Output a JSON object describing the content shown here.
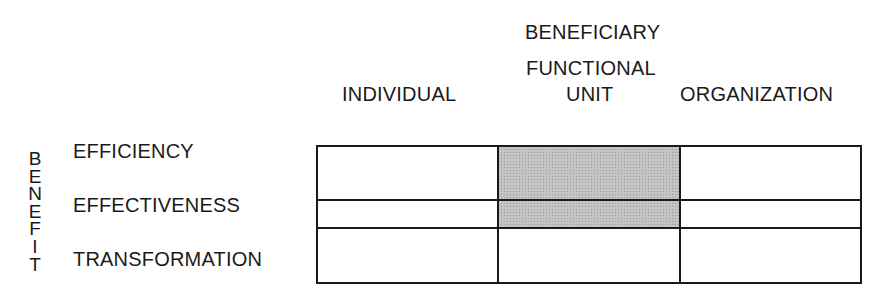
{
  "column_group_label": "BENEFICIARY",
  "columns": [
    {
      "label_line1": "",
      "label_line2": "INDIVIDUAL"
    },
    {
      "label_line1": "FUNCTIONAL",
      "label_line2": "UNIT"
    },
    {
      "label_line1": "",
      "label_line2": "ORGANIZATION"
    }
  ],
  "row_group_label": "BENEFIT",
  "row_group_letters": [
    "B",
    "E",
    "N",
    "E",
    "F",
    "I",
    "T"
  ],
  "rows": [
    {
      "label": "EFFICIENCY"
    },
    {
      "label": "EFFECTIVENESS"
    },
    {
      "label": "TRANSFORMATION"
    }
  ],
  "cells": [
    [
      {
        "shaded": false
      },
      {
        "shaded": true
      },
      {
        "shaded": false
      }
    ],
    [
      {
        "shaded": false
      },
      {
        "shaded": true
      },
      {
        "shaded": false
      }
    ],
    [
      {
        "shaded": false
      },
      {
        "shaded": false
      },
      {
        "shaded": false
      }
    ]
  ],
  "colors": {
    "line": "#1a1a1a",
    "shade": "#c4c4c4",
    "background": "#ffffff"
  }
}
